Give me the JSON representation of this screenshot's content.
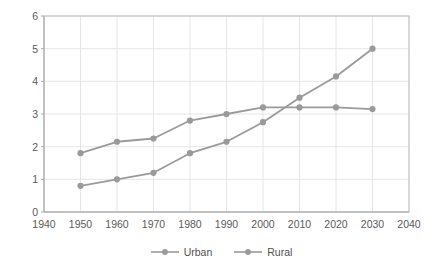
{
  "chart_data": {
    "type": "line",
    "title": "",
    "subtitle": "",
    "xlabel": "",
    "ylabel": "",
    "xlim": [
      1940,
      2040
    ],
    "ylim": [
      0,
      6
    ],
    "x": [
      1950,
      1960,
      1970,
      1980,
      1990,
      2000,
      2010,
      2020,
      2030
    ],
    "xticks": [
      "1940",
      "1950",
      "1960",
      "1970",
      "1980",
      "1990",
      "2000",
      "2010",
      "2020",
      "2030",
      "2040"
    ],
    "yticks": [
      "0",
      "1",
      "2",
      "3",
      "4",
      "5",
      "6"
    ],
    "grid": true,
    "legend_position": "bottom",
    "marker": "circle",
    "series": [
      {
        "name": "Urban",
        "color": "#9a9a9a",
        "values": [
          0.8,
          1.0,
          1.2,
          1.8,
          2.15,
          2.75,
          3.5,
          4.15,
          5.0
        ]
      },
      {
        "name": "Rural",
        "color": "#9a9a9a",
        "values": [
          1.8,
          2.15,
          2.25,
          2.8,
          3.0,
          3.2,
          3.2,
          3.2,
          3.15
        ]
      }
    ],
    "annotations": []
  },
  "legend": {
    "items": [
      {
        "label": "Urban"
      },
      {
        "label": "Rural"
      }
    ]
  },
  "colors": {
    "series": "#9a9a9a",
    "grid": "#e6e6e6",
    "axis": "#bdbdbd",
    "text": "#555555",
    "background": "#ffffff"
  }
}
